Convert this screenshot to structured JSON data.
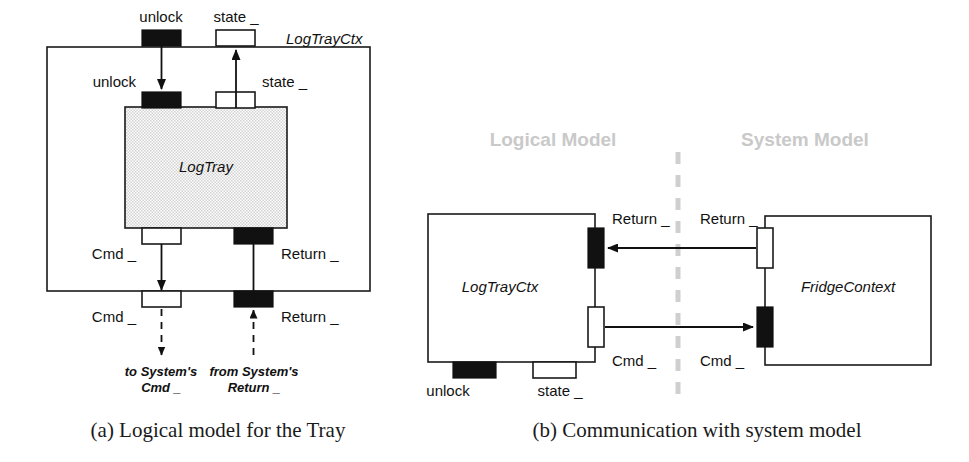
{
  "figure": {
    "panels": [
      {
        "id": "a",
        "caption": "(a) Logical model for the Tray",
        "outer_component": "LogTrayCtx",
        "inner_component": "LogTray",
        "ports": [
          {
            "name": "unlock-outer",
            "label": "unlock",
            "kind": "black"
          },
          {
            "name": "state-outer",
            "label": "state _",
            "kind": "white"
          },
          {
            "name": "unlock-inner",
            "label": "unlock",
            "kind": "black"
          },
          {
            "name": "state-inner",
            "label": "state _",
            "kind": "white"
          },
          {
            "name": "cmd-inner",
            "label": "Cmd _",
            "kind": "white"
          },
          {
            "name": "return-inner",
            "label": "Return _",
            "kind": "black"
          },
          {
            "name": "cmd-outer",
            "label": "Cmd _",
            "kind": "white"
          },
          {
            "name": "return-outer",
            "label": "Return _",
            "kind": "black"
          }
        ],
        "external": [
          {
            "name": "to-system-cmd",
            "line1": "to System's",
            "line2": "Cmd _"
          },
          {
            "name": "from-system-return",
            "line1": "from System's",
            "line2": "Return _"
          }
        ]
      },
      {
        "id": "b",
        "caption": "(b) Communication with system model",
        "regions": [
          {
            "name": "logical-model",
            "label": "Logical Model"
          },
          {
            "name": "system-model",
            "label": "System Model"
          }
        ],
        "left_component": "LogTrayCtx",
        "right_component": "FridgeContext",
        "ports": [
          {
            "name": "return-left",
            "label": "Return _",
            "kind": "black"
          },
          {
            "name": "return-right",
            "label": "Return _",
            "kind": "white"
          },
          {
            "name": "cmd-left",
            "label": "Cmd _",
            "kind": "white"
          },
          {
            "name": "cmd-right",
            "label": "Cmd _",
            "kind": "black"
          },
          {
            "name": "unlock-bottom",
            "label": "unlock",
            "kind": "black"
          },
          {
            "name": "state-bottom",
            "label": "state _",
            "kind": "white"
          }
        ]
      }
    ]
  },
  "colors": {
    "ink": "#111111",
    "region_gray": "#c9c9c9",
    "fill_stipple": "#dedede",
    "divider": "#cfcfcf"
  }
}
